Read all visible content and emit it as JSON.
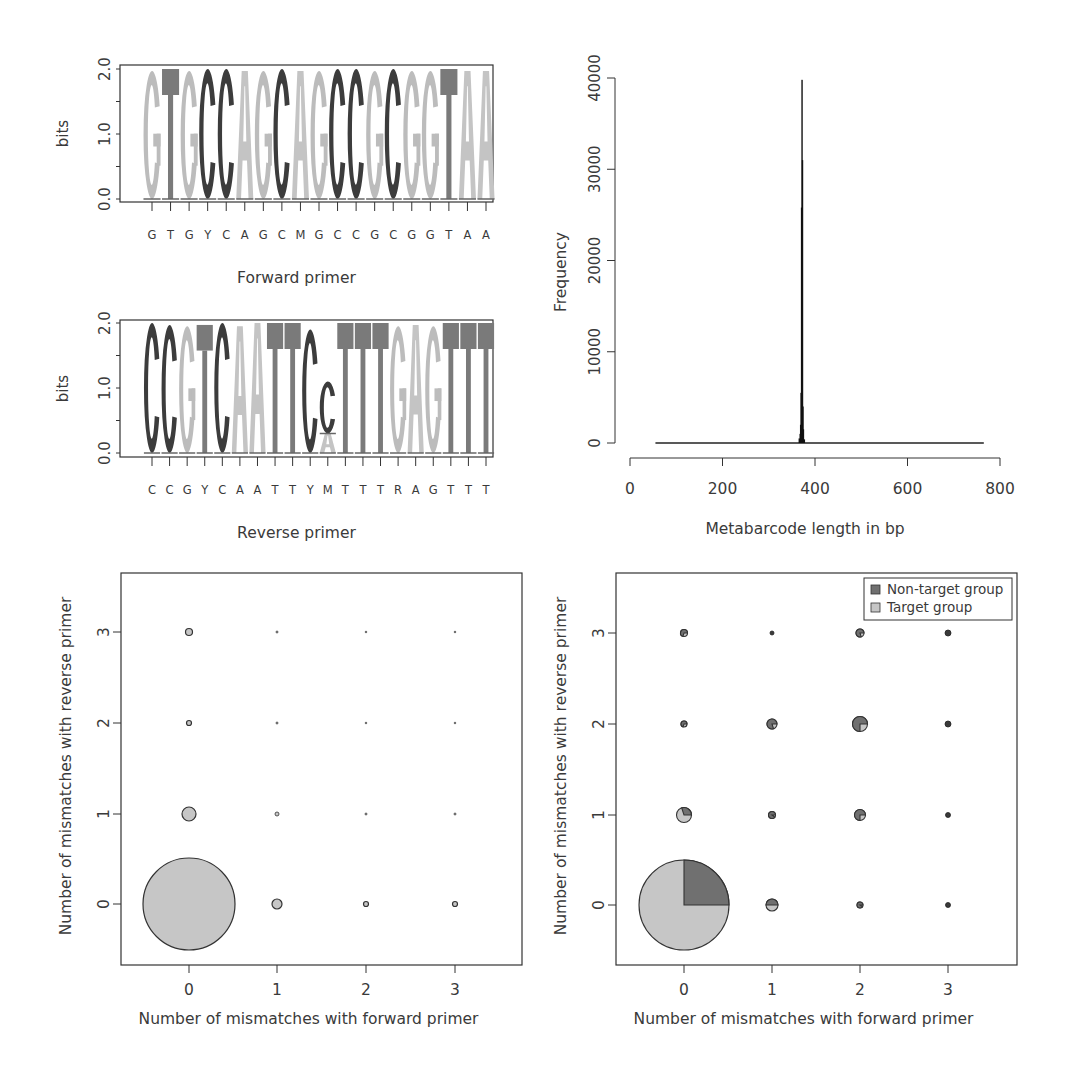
{
  "colors": {
    "A": "#c4c4c4",
    "G": "#bcbcbc",
    "C": "#3c3c3c",
    "T": "#7a7a7a",
    "target": "#c6c6c6",
    "non_target": "#707070",
    "axis": "#333333"
  },
  "chart_data": [
    {
      "type": "sequence_logo",
      "id": "forward_logo",
      "title": "",
      "xlabel": "Forward primer",
      "ylabel": "bits",
      "ylim": [
        0,
        2
      ],
      "yticks": [
        "0.0",
        "1.0",
        "2.0"
      ],
      "consensus": [
        "G",
        "T",
        "G",
        "Y",
        "C",
        "A",
        "G",
        "C",
        "M",
        "G",
        "C",
        "C",
        "G",
        "C",
        "G",
        "G",
        "T",
        "A",
        "A"
      ],
      "positions": [
        {
          "letters": [
            {
              "b": "G",
              "h": 1.97
            }
          ]
        },
        {
          "letters": [
            {
              "b": "T",
              "h": 2.0
            }
          ]
        },
        {
          "letters": [
            {
              "b": "G",
              "h": 1.97
            }
          ]
        },
        {
          "letters": [
            {
              "b": "C",
              "h": 2.0
            }
          ]
        },
        {
          "letters": [
            {
              "b": "C",
              "h": 2.0
            }
          ]
        },
        {
          "letters": [
            {
              "b": "A",
              "h": 1.97
            }
          ]
        },
        {
          "letters": [
            {
              "b": "G",
              "h": 1.97
            }
          ]
        },
        {
          "letters": [
            {
              "b": "C",
              "h": 2.0
            }
          ]
        },
        {
          "letters": [
            {
              "b": "A",
              "h": 1.97
            }
          ]
        },
        {
          "letters": [
            {
              "b": "G",
              "h": 1.97
            }
          ]
        },
        {
          "letters": [
            {
              "b": "C",
              "h": 2.0
            }
          ]
        },
        {
          "letters": [
            {
              "b": "C",
              "h": 2.0
            }
          ]
        },
        {
          "letters": [
            {
              "b": "G",
              "h": 1.97
            }
          ]
        },
        {
          "letters": [
            {
              "b": "C",
              "h": 2.0
            }
          ]
        },
        {
          "letters": [
            {
              "b": "G",
              "h": 1.97
            }
          ]
        },
        {
          "letters": [
            {
              "b": "G",
              "h": 1.97
            }
          ]
        },
        {
          "letters": [
            {
              "b": "T",
              "h": 2.0
            }
          ]
        },
        {
          "letters": [
            {
              "b": "A",
              "h": 1.97
            }
          ]
        },
        {
          "letters": [
            {
              "b": "A",
              "h": 1.97
            }
          ]
        }
      ]
    },
    {
      "type": "sequence_logo",
      "id": "reverse_logo",
      "title": "",
      "xlabel": "Reverse primer",
      "ylabel": "bits",
      "ylim": [
        0,
        2
      ],
      "yticks": [
        "0.0",
        "1.0",
        "2.0"
      ],
      "consensus": [
        "C",
        "C",
        "G",
        "Y",
        "C",
        "A",
        "A",
        "T",
        "T",
        "Y",
        "M",
        "T",
        "T",
        "T",
        "R",
        "A",
        "G",
        "T",
        "T",
        "T"
      ],
      "positions": [
        {
          "letters": [
            {
              "b": "C",
              "h": 2.0
            }
          ]
        },
        {
          "letters": [
            {
              "b": "C",
              "h": 1.97
            }
          ]
        },
        {
          "letters": [
            {
              "b": "G",
              "h": 1.95
            }
          ]
        },
        {
          "letters": [
            {
              "b": "T",
              "h": 1.97
            }
          ]
        },
        {
          "letters": [
            {
              "b": "C",
              "h": 2.0
            }
          ]
        },
        {
          "letters": [
            {
              "b": "A",
              "h": 1.95
            }
          ]
        },
        {
          "letters": [
            {
              "b": "A",
              "h": 2.0
            }
          ]
        },
        {
          "letters": [
            {
              "b": "T",
              "h": 2.0
            }
          ]
        },
        {
          "letters": [
            {
              "b": "T",
              "h": 2.0
            }
          ]
        },
        {
          "letters": [
            {
              "b": "C",
              "h": 1.9
            }
          ]
        },
        {
          "letters": [
            {
              "b": "A",
              "h": 0.3
            },
            {
              "b": "C",
              "h": 0.8
            }
          ]
        },
        {
          "letters": [
            {
              "b": "T",
              "h": 2.0
            }
          ]
        },
        {
          "letters": [
            {
              "b": "T",
              "h": 2.0
            }
          ]
        },
        {
          "letters": [
            {
              "b": "T",
              "h": 2.0
            }
          ]
        },
        {
          "letters": [
            {
              "b": "G",
              "h": 1.95
            }
          ]
        },
        {
          "letters": [
            {
              "b": "A",
              "h": 1.97
            }
          ]
        },
        {
          "letters": [
            {
              "b": "G",
              "h": 1.95
            }
          ]
        },
        {
          "letters": [
            {
              "b": "T",
              "h": 2.0
            }
          ]
        },
        {
          "letters": [
            {
              "b": "T",
              "h": 2.0
            }
          ]
        },
        {
          "letters": [
            {
              "b": "T",
              "h": 2.0
            }
          ]
        }
      ]
    },
    {
      "type": "histogram",
      "id": "length_histogram",
      "title": "",
      "xlabel": "Metabarcode length in bp",
      "ylabel": "Frequency",
      "xlim": [
        0,
        800
      ],
      "ylim": [
        0,
        40000
      ],
      "xticks": [
        "0",
        "200",
        "400",
        "600",
        "800"
      ],
      "yticks": [
        "0",
        "10000",
        "20000",
        "30000",
        "40000"
      ],
      "data_range": [
        55,
        765
      ],
      "bins": [
        {
          "x": 366,
          "y": 500
        },
        {
          "x": 368,
          "y": 1000
        },
        {
          "x": 369,
          "y": 2000
        },
        {
          "x": 370,
          "y": 5500
        },
        {
          "x": 371,
          "y": 25800
        },
        {
          "x": 372,
          "y": 39800
        },
        {
          "x": 373,
          "y": 31000
        },
        {
          "x": 374,
          "y": 4000
        },
        {
          "x": 375,
          "y": 1500
        },
        {
          "x": 377,
          "y": 400
        }
      ]
    },
    {
      "type": "bubble",
      "id": "mismatch_bubble_target",
      "title": "",
      "xlabel": "Number of mismatches with forward primer",
      "ylabel": "Number of mismatches with reverse primer",
      "xticks": [
        "0",
        "1",
        "2",
        "3"
      ],
      "yticks": [
        "0",
        "1",
        "2",
        "3"
      ],
      "xlim": [
        -0.75,
        3.75
      ],
      "ylim": [
        -0.65,
        3.65
      ],
      "points": [
        {
          "x": 0,
          "y": 0,
          "r": 46
        },
        {
          "x": 1,
          "y": 0,
          "r": 5
        },
        {
          "x": 2,
          "y": 0,
          "r": 2.5
        },
        {
          "x": 3,
          "y": 0,
          "r": 2.5
        },
        {
          "x": 0,
          "y": 1,
          "r": 7
        },
        {
          "x": 1,
          "y": 1,
          "r": 2
        },
        {
          "x": 2,
          "y": 1,
          "r": 1
        },
        {
          "x": 3,
          "y": 1,
          "r": 1
        },
        {
          "x": 0,
          "y": 2,
          "r": 2.5
        },
        {
          "x": 1,
          "y": 2,
          "r": 1
        },
        {
          "x": 2,
          "y": 2,
          "r": 0.8
        },
        {
          "x": 3,
          "y": 2,
          "r": 0.8
        },
        {
          "x": 0,
          "y": 3,
          "r": 3.5
        },
        {
          "x": 1,
          "y": 3,
          "r": 1
        },
        {
          "x": 2,
          "y": 3,
          "r": 0.8
        },
        {
          "x": 3,
          "y": 3,
          "r": 0.8
        }
      ]
    },
    {
      "type": "bubble_pie",
      "id": "mismatch_bubble_groups",
      "title": "",
      "xlabel": "Number of mismatches with forward primer",
      "ylabel": "Number of mismatches with reverse primer",
      "xticks": [
        "0",
        "1",
        "2",
        "3"
      ],
      "yticks": [
        "0",
        "1",
        "2",
        "3"
      ],
      "xlim": [
        -0.75,
        3.75
      ],
      "ylim": [
        -0.65,
        3.65
      ],
      "legend": [
        {
          "label": "Non-target group",
          "color_key": "non_target"
        },
        {
          "label": "Target group",
          "color_key": "target"
        }
      ],
      "legend_position": "topright",
      "points": [
        {
          "x": 0,
          "y": 0,
          "r": 45,
          "non_target_frac": 0.25
        },
        {
          "x": 1,
          "y": 0,
          "r": 6,
          "non_target_frac": 0.5
        },
        {
          "x": 2,
          "y": 0,
          "r": 3,
          "non_target_frac": 0.9
        },
        {
          "x": 3,
          "y": 0,
          "r": 2.5,
          "non_target_frac": 1.0
        },
        {
          "x": 0,
          "y": 1,
          "r": 7.5,
          "non_target_frac": 0.3
        },
        {
          "x": 1,
          "y": 1,
          "r": 3.5,
          "non_target_frac": 0.9
        },
        {
          "x": 2,
          "y": 1,
          "r": 5.5,
          "non_target_frac": 0.75
        },
        {
          "x": 3,
          "y": 1,
          "r": 2.5,
          "non_target_frac": 1.0
        },
        {
          "x": 0,
          "y": 2,
          "r": 3,
          "non_target_frac": 0.7
        },
        {
          "x": 1,
          "y": 2,
          "r": 5,
          "non_target_frac": 0.8
        },
        {
          "x": 2,
          "y": 2,
          "r": 7.5,
          "non_target_frac": 0.75
        },
        {
          "x": 3,
          "y": 2,
          "r": 3,
          "non_target_frac": 1.0
        },
        {
          "x": 0,
          "y": 3,
          "r": 3.5,
          "non_target_frac": 0.7
        },
        {
          "x": 1,
          "y": 3,
          "r": 2,
          "non_target_frac": 1.0
        },
        {
          "x": 2,
          "y": 3,
          "r": 4,
          "non_target_frac": 0.8
        },
        {
          "x": 3,
          "y": 3,
          "r": 3,
          "non_target_frac": 1.0
        }
      ]
    }
  ]
}
